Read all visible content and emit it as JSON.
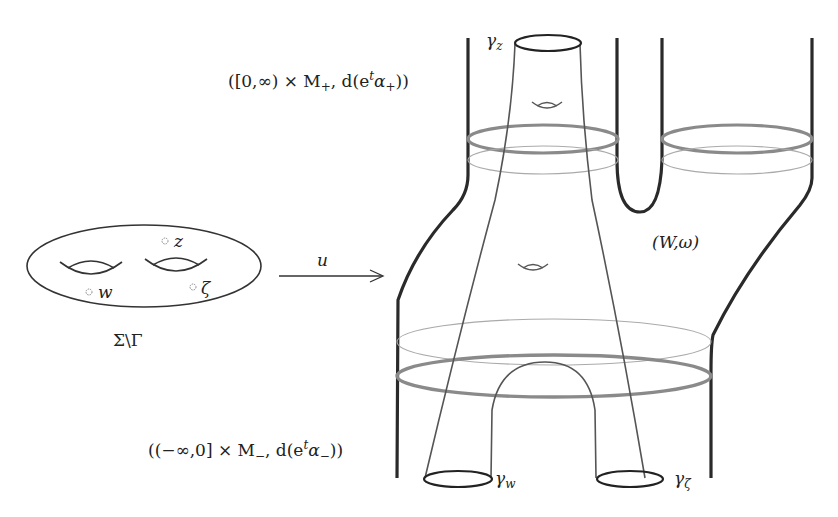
{
  "diagram": {
    "domain_surface": {
      "label": "Σ\\Γ",
      "punctures": [
        {
          "name": "z",
          "label": "z"
        },
        {
          "name": "w",
          "label": "w"
        },
        {
          "name": "zeta",
          "label": "ζ"
        }
      ],
      "genus": 2
    },
    "map": {
      "label": "u"
    },
    "target": {
      "label": "(W,ω)",
      "positive_end": {
        "label_open": "([0,∞) × M",
        "sub": "+",
        "label_mid": ", d(e",
        "sup": "t",
        "label_alpha": "α",
        "sub2": "+",
        "label_close": "))"
      },
      "negative_end": {
        "label_open": "((−∞,0] × M",
        "sub": "−",
        "label_mid": ", d(e",
        "sup": "t",
        "label_alpha": "α",
        "sub2": "−",
        "label_close": "))"
      }
    },
    "orbits": [
      {
        "name": "gamma-z",
        "symbol": "γ",
        "sub": "z",
        "end": "positive"
      },
      {
        "name": "gamma-w",
        "symbol": "γ",
        "sub": "w",
        "end": "negative"
      },
      {
        "name": "gamma-zeta",
        "symbol": "γ",
        "sub": "ζ",
        "end": "negative"
      }
    ],
    "colors": {
      "ink": "#222222",
      "thick_ring": "#8a8a8a",
      "thin_ring": "#a8a8a8",
      "curve": "#555555"
    }
  }
}
